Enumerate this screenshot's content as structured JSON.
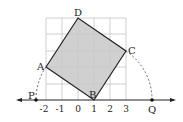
{
  "diagram": {
    "number_line": {
      "ticks": [
        "-2",
        "-1",
        "0",
        "1",
        "2",
        "3"
      ],
      "tick_values": [
        -2,
        -1,
        0,
        1,
        2,
        3
      ]
    },
    "points": {
      "A": {
        "label": "A",
        "x": -2,
        "y": 2
      },
      "B": {
        "label": "B",
        "x": 1,
        "y": 0
      },
      "C": {
        "label": "C",
        "x": 3,
        "y": 3
      },
      "D": {
        "label": "D",
        "x": 0,
        "y": 5
      },
      "P": {
        "label": "P"
      },
      "Q": {
        "label": "Q"
      }
    },
    "colors": {
      "square_fill": "#c8c8c8",
      "grid": "#c0c0c0",
      "lines": "#222222"
    }
  }
}
